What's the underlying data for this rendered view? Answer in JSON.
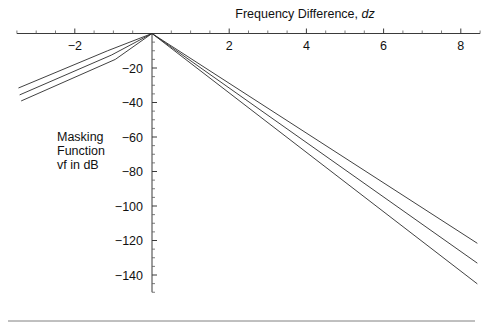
{
  "chart_data": {
    "type": "line",
    "title": "Frequency Difference, dz",
    "title_plain": "Frequency Difference,",
    "title_italic": "dz",
    "xlabel": "Frequency Difference, dz",
    "ylabel_lines": [
      "Masking",
      "Function",
      "vf in dB"
    ],
    "ylabel": "Masking Function vf in dB",
    "xlim": [
      -3.5,
      8.5
    ],
    "ylim": [
      -150,
      5
    ],
    "x_ticks": [
      -2,
      2,
      4,
      6,
      8
    ],
    "x_tick_labels": [
      "−2",
      "2",
      "4",
      "6",
      "8"
    ],
    "x_minor_step": 0.5,
    "y_ticks": [
      -20,
      -40,
      -60,
      -80,
      -100,
      -120,
      -140
    ],
    "y_tick_labels": [
      "−20",
      "−40",
      "−60",
      "−80",
      "−100",
      "−120",
      "−140"
    ],
    "y_minor_step": 5,
    "grid": false,
    "legend": null,
    "axis_color": "#3a3a3a",
    "curve_color": "#2b2b2b",
    "background": "#ffffff",
    "series": [
      {
        "name": "upper",
        "points": [
          [
            -3.45,
            -31.5
          ],
          [
            -1.15,
            -10.0
          ],
          [
            0.0,
            0.0
          ],
          [
            8.42,
            -121.5
          ]
        ]
      },
      {
        "name": "middle",
        "points": [
          [
            -3.42,
            -35.5
          ],
          [
            -1.05,
            -12.5
          ],
          [
            0.0,
            0.0
          ],
          [
            8.42,
            -133.0
          ]
        ]
      },
      {
        "name": "lower",
        "points": [
          [
            -3.38,
            -39.0
          ],
          [
            -0.95,
            -15.0
          ],
          [
            0.0,
            0.0
          ],
          [
            8.42,
            -145.0
          ]
        ]
      }
    ],
    "footer_rule": true
  }
}
